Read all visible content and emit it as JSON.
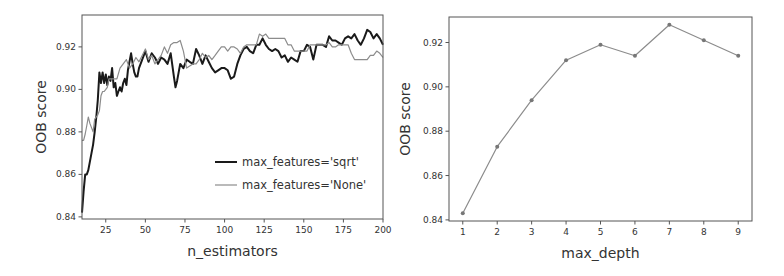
{
  "chart_data": [
    {
      "type": "line",
      "title": "",
      "xlabel": "n_estimators",
      "ylabel": "OOB score",
      "xlim": [
        10,
        200
      ],
      "ylim": [
        0.839,
        0.935
      ],
      "xticks": [
        25,
        50,
        75,
        100,
        125,
        150,
        175,
        200
      ],
      "xtick_labels": [
        "25",
        "50",
        "75",
        "100",
        "125",
        "150",
        "175",
        "200"
      ],
      "yticks": [
        0.84,
        0.86,
        0.88,
        0.9,
        0.92
      ],
      "ytick_labels": [
        "0.84",
        "0.86",
        "0.88",
        "0.90",
        "0.92"
      ],
      "grid": false,
      "legend_position": "lower right",
      "series": [
        {
          "name": "max_features='sqrt'",
          "color": "#1a1a1a",
          "x": [
            10,
            11,
            12,
            13,
            14,
            15,
            16,
            17,
            18,
            19,
            20,
            21,
            22,
            23,
            24,
            25,
            26,
            27,
            28,
            29,
            30,
            31,
            32,
            33,
            34,
            35,
            36,
            37,
            38,
            39,
            40,
            41,
            42,
            43,
            44,
            45,
            46,
            48,
            50,
            52,
            54,
            56,
            58,
            60,
            62,
            64,
            66,
            68,
            69,
            70,
            72,
            74,
            76,
            78,
            80,
            82,
            84,
            86,
            88,
            90,
            92,
            94,
            96,
            98,
            100,
            102,
            104,
            106,
            108,
            110,
            112,
            114,
            116,
            118,
            120,
            122,
            124,
            126,
            128,
            130,
            132,
            134,
            136,
            138,
            140,
            142,
            144,
            146,
            148,
            150,
            152,
            154,
            156,
            158,
            160,
            162,
            164,
            166,
            168,
            170,
            172,
            174,
            176,
            178,
            180,
            182,
            184,
            186,
            188,
            190,
            192,
            194,
            196,
            198,
            200
          ],
          "values": [
            0.842,
            0.852,
            0.86,
            0.86,
            0.862,
            0.866,
            0.87,
            0.874,
            0.88,
            0.887,
            0.895,
            0.908,
            0.903,
            0.908,
            0.903,
            0.907,
            0.902,
            0.906,
            0.904,
            0.91,
            0.901,
            0.903,
            0.897,
            0.899,
            0.901,
            0.899,
            0.903,
            0.905,
            0.902,
            0.909,
            0.913,
            0.917,
            0.912,
            0.908,
            0.906,
            0.906,
            0.91,
            0.914,
            0.918,
            0.913,
            0.917,
            0.915,
            0.912,
            0.915,
            0.914,
            0.912,
            0.917,
            0.906,
            0.901,
            0.904,
            0.912,
            0.91,
            0.914,
            0.913,
            0.912,
            0.919,
            0.916,
            0.912,
            0.916,
            0.913,
            0.91,
            0.908,
            0.909,
            0.91,
            0.91,
            0.909,
            0.905,
            0.906,
            0.912,
            0.916,
            0.919,
            0.92,
            0.918,
            0.917,
            0.921,
            0.921,
            0.924,
            0.921,
            0.919,
            0.918,
            0.919,
            0.918,
            0.915,
            0.916,
            0.913,
            0.915,
            0.914,
            0.913,
            0.918,
            0.918,
            0.921,
            0.92,
            0.914,
            0.921,
            0.921,
            0.921,
            0.92,
            0.925,
            0.923,
            0.923,
            0.922,
            0.921,
            0.924,
            0.925,
            0.924,
            0.926,
            0.923,
            0.921,
            0.924,
            0.928,
            0.927,
            0.924,
            0.926,
            0.924,
            0.921
          ]
        },
        {
          "name": "max_features='None'",
          "color": "#8c8c8c",
          "x": [
            10,
            11,
            12,
            13,
            14,
            15,
            16,
            17,
            18,
            19,
            20,
            21,
            22,
            23,
            24,
            25,
            26,
            27,
            28,
            29,
            30,
            32,
            34,
            36,
            38,
            40,
            42,
            44,
            46,
            48,
            50,
            52,
            54,
            56,
            58,
            60,
            62,
            64,
            66,
            68,
            70,
            72,
            74,
            76,
            78,
            80,
            82,
            84,
            86,
            88,
            90,
            92,
            94,
            96,
            98,
            100,
            102,
            104,
            106,
            108,
            110,
            112,
            114,
            116,
            118,
            120,
            122,
            124,
            126,
            128,
            130,
            132,
            134,
            136,
            138,
            140,
            142,
            144,
            146,
            148,
            150,
            152,
            154,
            156,
            158,
            160,
            162,
            164,
            166,
            168,
            170,
            172,
            174,
            176,
            178,
            180,
            182,
            184,
            186,
            188,
            190,
            192,
            194,
            196,
            198,
            200
          ],
          "values": [
            0.876,
            0.876,
            0.879,
            0.883,
            0.887,
            0.884,
            0.882,
            0.88,
            0.886,
            0.887,
            0.888,
            0.89,
            0.897,
            0.899,
            0.899,
            0.9,
            0.901,
            0.905,
            0.905,
            0.905,
            0.905,
            0.905,
            0.91,
            0.912,
            0.914,
            0.91,
            0.912,
            0.915,
            0.913,
            0.916,
            0.919,
            0.914,
            0.916,
            0.912,
            0.914,
            0.916,
            0.92,
            0.917,
            0.921,
            0.922,
            0.922,
            0.923,
            0.918,
            0.91,
            0.911,
            0.912,
            0.912,
            0.914,
            0.917,
            0.915,
            0.916,
            0.914,
            0.916,
            0.918,
            0.92,
            0.92,
            0.918,
            0.92,
            0.92,
            0.919,
            0.917,
            0.92,
            0.921,
            0.921,
            0.921,
            0.921,
            0.926,
            0.925,
            0.926,
            0.924,
            0.924,
            0.924,
            0.924,
            0.924,
            0.924,
            0.921,
            0.921,
            0.918,
            0.918,
            0.918,
            0.918,
            0.918,
            0.921,
            0.921,
            0.921,
            0.921,
            0.921,
            0.921,
            0.922,
            0.92,
            0.92,
            0.921,
            0.921,
            0.921,
            0.921,
            0.917,
            0.914,
            0.914,
            0.914,
            0.914,
            0.914,
            0.916,
            0.916,
            0.918,
            0.917,
            0.915
          ]
        }
      ]
    },
    {
      "type": "line",
      "title": "",
      "xlabel": "max_depth",
      "ylabel": "OOB score",
      "xlim": [
        0.6,
        9.4
      ],
      "ylim": [
        0.8395,
        0.9315
      ],
      "xticks": [
        1,
        2,
        3,
        4,
        5,
        6,
        7,
        8,
        9
      ],
      "xtick_labels": [
        "1",
        "2",
        "3",
        "4",
        "5",
        "6",
        "7",
        "8",
        "9"
      ],
      "yticks": [
        0.84,
        0.86,
        0.88,
        0.9,
        0.92
      ],
      "ytick_labels": [
        "0.84",
        "0.86",
        "0.88",
        "0.90",
        "0.92"
      ],
      "grid": false,
      "categories": [
        1,
        2,
        3,
        4,
        5,
        6,
        7,
        8,
        9
      ],
      "series": [
        {
          "name": "OOB score",
          "color": "#8c8c8c",
          "marker": "dot",
          "values": [
            0.843,
            0.873,
            0.894,
            0.912,
            0.919,
            0.914,
            0.928,
            0.921,
            0.914
          ]
        }
      ]
    }
  ]
}
